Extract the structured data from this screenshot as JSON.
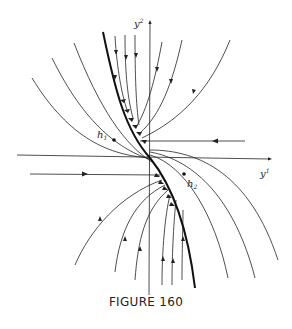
{
  "figure": {
    "caption": "FIGURE 160",
    "axes": {
      "vertical_label": "y",
      "vertical_sup": "2",
      "horizontal_label": "y",
      "horizontal_sup": "1"
    },
    "points": [
      {
        "label": "h",
        "sub": "1"
      },
      {
        "label": "h",
        "sub": "2"
      }
    ],
    "colors": {
      "ink": "#222222",
      "background": "#ffffff"
    }
  }
}
